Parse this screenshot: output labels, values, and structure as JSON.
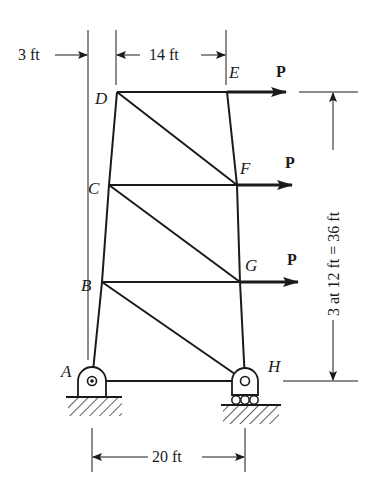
{
  "diagram": {
    "type": "plane truss",
    "nodes": [
      {
        "id": "A",
        "label": "A",
        "x": 92,
        "y": 381
      },
      {
        "id": "B",
        "label": "B",
        "x": 102,
        "y": 282
      },
      {
        "id": "C",
        "label": "C",
        "x": 109,
        "y": 185
      },
      {
        "id": "D",
        "label": "D",
        "x": 117,
        "y": 92
      },
      {
        "id": "E",
        "label": "E",
        "x": 227,
        "y": 92
      },
      {
        "id": "F",
        "label": "F",
        "x": 237,
        "y": 185
      },
      {
        "id": "G",
        "label": "G",
        "x": 240,
        "y": 282
      },
      {
        "id": "H",
        "label": "H",
        "x": 245,
        "y": 381
      }
    ],
    "members": [
      [
        "A",
        "B"
      ],
      [
        "B",
        "C"
      ],
      [
        "C",
        "D"
      ],
      [
        "D",
        "E"
      ],
      [
        "E",
        "F"
      ],
      [
        "F",
        "G"
      ],
      [
        "G",
        "H"
      ],
      [
        "A",
        "H"
      ],
      [
        "B",
        "G"
      ],
      [
        "C",
        "F"
      ],
      [
        "D",
        "F"
      ],
      [
        "C",
        "G"
      ],
      [
        "B",
        "H"
      ]
    ],
    "supports": [
      {
        "node": "A",
        "type": "pin"
      },
      {
        "node": "H",
        "type": "roller"
      }
    ],
    "loads": [
      {
        "node": "E",
        "label": "P",
        "direction": "right"
      },
      {
        "node": "F",
        "label": "P",
        "direction": "right"
      },
      {
        "node": "G",
        "label": "P",
        "direction": "right"
      }
    ],
    "dimensions": {
      "left_offset": "3 ft",
      "top_width": "14 ft",
      "bottom_width": "20 ft",
      "height": "3 at 12 ft = 36 ft"
    }
  }
}
